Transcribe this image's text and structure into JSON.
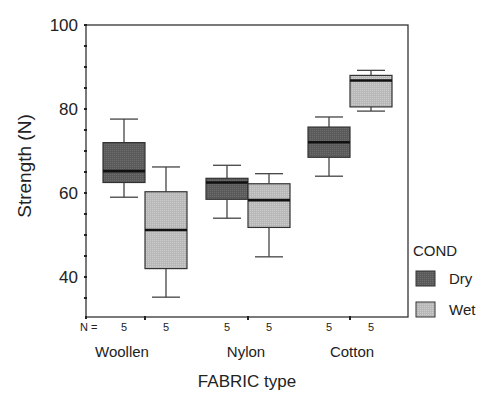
{
  "chart_data": {
    "type": "boxplot",
    "title": "",
    "xlabel": "FABRIC type",
    "ylabel": "Strength (N)",
    "ylim": [
      30.5,
      100
    ],
    "yticks": [
      40,
      60,
      80,
      100
    ],
    "grid": false,
    "categories": [
      "Woollen",
      "Nylon",
      "Cotton"
    ],
    "legend": {
      "title": "COND",
      "position": "right",
      "entries": [
        "Dry",
        "Wet"
      ]
    },
    "n_label": "N =",
    "series": [
      {
        "name": "Dry",
        "color": "#5a5a5a",
        "n": [
          5,
          5,
          5
        ],
        "boxes": [
          {
            "whisker_low": 59,
            "q1": 62.5,
            "median": 65.2,
            "q3": 72,
            "whisker_high": 77.6
          },
          {
            "whisker_low": 54,
            "q1": 58.5,
            "median": 62.5,
            "q3": 63.5,
            "whisker_high": 66.6
          },
          {
            "whisker_low": 64,
            "q1": 68.5,
            "median": 72.1,
            "q3": 75.7,
            "whisker_high": 78.1
          }
        ]
      },
      {
        "name": "Wet",
        "color": "#b8b8b8",
        "n": [
          5,
          5,
          5
        ],
        "boxes": [
          {
            "whisker_low": 35.2,
            "q1": 42,
            "median": 51.2,
            "q3": 60.3,
            "whisker_high": 66.2
          },
          {
            "whisker_low": 44.8,
            "q1": 51.8,
            "median": 58.3,
            "q3": 62.2,
            "whisker_high": 64.6
          },
          {
            "whisker_low": 79.5,
            "q1": 80.5,
            "median": 86.8,
            "q3": 88,
            "whisker_high": 89.2
          }
        ]
      }
    ]
  }
}
